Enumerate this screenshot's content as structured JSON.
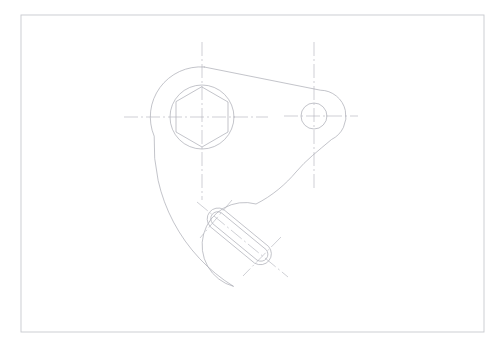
{
  "document": {
    "type": "cad-technical-drawing",
    "title": "Mechanical Bracket Plate — Orthographic View",
    "view_label": "",
    "background_color": "#ffffff",
    "canvas": {
      "width": 504,
      "height": 346
    }
  },
  "styles": {
    "outline_color": "#a9abb3",
    "outline_width": 0.7,
    "hidden_color": "#b9bcc4",
    "centerline_color": "#aeb0b8",
    "centerline_width": 0.6,
    "border_color": "#c7c9ce",
    "border_width": 0.9
  },
  "sheet_border": {
    "name": "drawing-frame",
    "x": 21,
    "y": 15,
    "width": 463,
    "height": 317
  },
  "geometry": {
    "main_boss": {
      "label": "large-hub",
      "center": {
        "x": 202,
        "y": 117
      },
      "outer_radius": 50,
      "bore_radius": 32,
      "hex_across_flats": 26,
      "hex_circumradius": 30,
      "hex_rotation_deg": 0
    },
    "pin_boss": {
      "label": "small-hub",
      "center": {
        "x": 314,
        "y": 116
      },
      "outer_radius": 26,
      "bore_radius": 13
    },
    "slot": {
      "label": "oblong-slot",
      "end_a": {
        "x": 217,
        "y": 218
      },
      "end_b": {
        "x": 262,
        "y": 255
      },
      "slot_radius": 11,
      "inner_radius": 7,
      "angle_deg": 39.4
    },
    "slot_boss": {
      "label": "slot-lobe",
      "center": {
        "x": 262,
        "y": 255
      },
      "outer_radius": 32
    },
    "tangent_top": {
      "label": "upper-tangent-edge",
      "from": {
        "x": 204,
        "y": 67
      },
      "to": {
        "x": 320,
        "y": 90
      }
    },
    "left_profile": {
      "label": "left-sweep-arc",
      "from": {
        "x": 154,
        "y": 136
      },
      "to": {
        "x": 233,
        "y": 286
      },
      "radius": 168
    },
    "s_curve": {
      "label": "right-waist-curve",
      "from": {
        "x": 331,
        "y": 140
      },
      "to": {
        "x": 250,
        "y": 208
      }
    }
  },
  "centerlines": [
    {
      "name": "main-boss-vertical",
      "x1": 202,
      "y1": 42,
      "x2": 202,
      "y2": 200
    },
    {
      "name": "main-boss-horizontal",
      "x1": 124,
      "y1": 117,
      "x2": 268,
      "y2": 117
    },
    {
      "name": "pin-boss-vertical",
      "x1": 314,
      "y1": 42,
      "x2": 314,
      "y2": 190
    },
    {
      "name": "pin-boss-horizontal",
      "x1": 284,
      "y1": 116,
      "x2": 358,
      "y2": 116
    },
    {
      "name": "slot-axis",
      "x1": 197,
      "y1": 202,
      "x2": 288,
      "y2": 277
    },
    {
      "name": "slot-end-a-cross",
      "x1": 232,
      "y1": 200,
      "x2": 200,
      "y2": 238
    },
    {
      "name": "slot-end-b-cross",
      "x1": 281,
      "y1": 237,
      "x2": 243,
      "y2": 276
    }
  ],
  "legend": {
    "line_types": [
      {
        "name": "visible-outline",
        "description": "Continuous thin"
      },
      {
        "name": "center-line",
        "description": "Long dash dot"
      }
    ]
  }
}
